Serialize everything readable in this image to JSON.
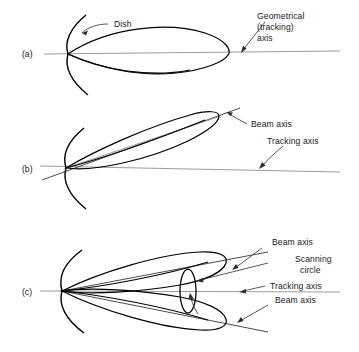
{
  "figure": {
    "background_color": "#ffffff",
    "line_color": "#000000",
    "axis_color": "#9b9b9b",
    "text_color": "#1a1a1a"
  },
  "panels": [
    {
      "id": "a",
      "label": "(a)",
      "description": "On-axis beam aligned with geometrical tracking axis",
      "labels": {
        "dish": "Dish",
        "axis_line1": "Geometrical",
        "axis_line2": "(tracking)",
        "axis_line3": "axis"
      }
    },
    {
      "id": "b",
      "label": "(b)",
      "description": "Squinted beam tilted off the tracking axis",
      "labels": {
        "beam_axis": "Beam axis",
        "tracking_axis": "Tracking axis"
      }
    },
    {
      "id": "c",
      "label": "(c)",
      "description": "Conical scan: two beam positions about the tracking axis with scanning circle",
      "labels": {
        "beam_axis_upper": "Beam axis",
        "scanning_circle_line1": "Scanning",
        "scanning_circle_line2": "circle",
        "tracking_axis": "Tracking axis",
        "beam_axis_lower": "Beam axis"
      }
    }
  ]
}
